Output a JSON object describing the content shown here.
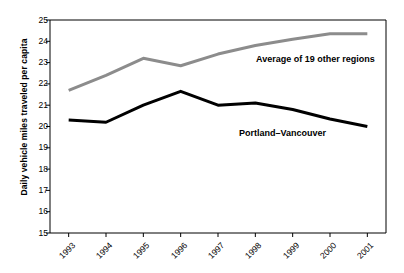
{
  "chart_data": {
    "type": "line",
    "title": "",
    "subtitle": "",
    "xlabel": "",
    "ylabel": "Daily vehicle miles traveled per capita",
    "categories": [
      "1993",
      "1994",
      "1995",
      "1996",
      "1997",
      "1998",
      "1999",
      "2000",
      "2001"
    ],
    "x": [
      1993,
      1994,
      1995,
      1996,
      1997,
      1998,
      1999,
      2000,
      2001
    ],
    "ylim": [
      15,
      25
    ],
    "y_ticks": [
      15,
      16,
      17,
      18,
      19,
      20,
      21,
      22,
      23,
      24,
      25
    ],
    "y_tick_labels": [
      "15",
      "16",
      "17",
      "18",
      "19",
      "20",
      "21",
      "22",
      "23",
      "24",
      "25"
    ],
    "grid": false,
    "legend": "inline-annotations",
    "series": [
      {
        "name": "Average of 19 other regions",
        "color": "#8c8c8c",
        "values": [
          21.7,
          22.4,
          23.2,
          22.85,
          23.4,
          23.8,
          24.1,
          24.35,
          24.35
        ]
      },
      {
        "name": "Portland–Vancouver",
        "color": "#000000",
        "values": [
          20.3,
          20.2,
          21.0,
          21.65,
          21.0,
          21.1,
          20.8,
          20.35,
          20.0
        ]
      }
    ],
    "annotations": [
      {
        "text": "Average of 19 other regions",
        "x_px": 256,
        "y_px": 54
      },
      {
        "text": "Portland–Vancouver",
        "x_px": 239,
        "y_px": 128
      }
    ]
  },
  "colors": {
    "background": "#ffffff",
    "axis": "#000000",
    "series_gray": "#8c8c8c",
    "series_black": "#000000",
    "text": "#000000"
  }
}
